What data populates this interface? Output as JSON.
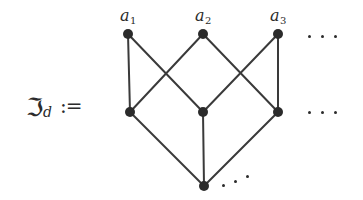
{
  "figure": {
    "caption_symbol": "ℑ",
    "caption_subscript": "d",
    "caption_assign": ":=",
    "background_color": "#ffffff",
    "ink_color": "#2b2b2b",
    "edge_color": "#3a3a3a"
  },
  "labels": {
    "a1_base": "a",
    "a1_index": "1",
    "a2_base": "a",
    "a2_index": "2",
    "a3_base": "a",
    "a3_index": "3"
  },
  "chart_data": {
    "type": "diagram",
    "nodes": [
      {
        "id": "a1",
        "label": "a_1",
        "x": 128,
        "y": 34,
        "row": "top"
      },
      {
        "id": "a2",
        "label": "a_2",
        "x": 203,
        "y": 34,
        "row": "top"
      },
      {
        "id": "a3",
        "label": "a_3",
        "x": 278,
        "y": 34,
        "row": "top"
      },
      {
        "id": "b1",
        "label": "",
        "x": 130,
        "y": 112,
        "row": "middle"
      },
      {
        "id": "b2",
        "label": "",
        "x": 203,
        "y": 112,
        "row": "middle"
      },
      {
        "id": "b3",
        "label": "",
        "x": 278,
        "y": 112,
        "row": "middle"
      },
      {
        "id": "c1",
        "label": "",
        "x": 204,
        "y": 186,
        "row": "bottom"
      }
    ],
    "edges": [
      {
        "from": "a1",
        "to": "b1"
      },
      {
        "from": "a1",
        "to": "b2"
      },
      {
        "from": "a2",
        "to": "b1"
      },
      {
        "from": "a2",
        "to": "b3"
      },
      {
        "from": "a3",
        "to": "b2"
      },
      {
        "from": "a3",
        "to": "b3"
      },
      {
        "from": "b1",
        "to": "c1"
      },
      {
        "from": "b2",
        "to": "c1"
      },
      {
        "from": "b3",
        "to": "c1"
      }
    ],
    "ellipses": [
      {
        "id": "top-right",
        "x": 310,
        "y": 36,
        "orientation": "horizontal"
      },
      {
        "id": "middle-right",
        "x": 310,
        "y": 112,
        "orientation": "horizontal"
      },
      {
        "id": "bottom-right",
        "x": 224,
        "y": 182,
        "orientation": "diagonal-up"
      }
    ],
    "node_radius": 5,
    "edge_width": 2
  }
}
